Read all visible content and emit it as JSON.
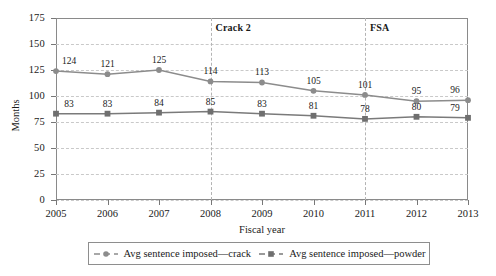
{
  "chart_data": {
    "type": "line",
    "title": "",
    "xlabel": "Fiscal year",
    "ylabel": "Months",
    "categories": [
      "2005",
      "2006",
      "2007",
      "2008",
      "2009",
      "2010",
      "2011",
      "2012",
      "2013"
    ],
    "x": [
      2005,
      2006,
      2007,
      2008,
      2009,
      2010,
      2011,
      2012,
      2013
    ],
    "xlim": [
      2005,
      2013
    ],
    "ylim": [
      0,
      175
    ],
    "yticks": [
      0,
      25,
      50,
      75,
      100,
      125,
      150,
      175
    ],
    "ytick_labels": [
      "0",
      "25",
      "50",
      "75",
      "100",
      "125",
      "150",
      "175"
    ],
    "grid": true,
    "grid_style": "dashed-horizontal",
    "legend_position": "below-axis",
    "series": [
      {
        "name": "Avg sentence imposed—crack",
        "marker": "circle",
        "color": "#8c8c8c",
        "values": [
          124,
          121,
          125,
          114,
          113,
          105,
          101,
          95,
          96
        ],
        "labels": [
          "124",
          "121",
          "125",
          "114",
          "113",
          "105",
          "101",
          "95",
          "96"
        ]
      },
      {
        "name": "Avg sentence imposed—powder",
        "marker": "square",
        "color": "#7a7a7a",
        "values": [
          83,
          83,
          84,
          85,
          83,
          81,
          78,
          80,
          79
        ],
        "labels": [
          "83",
          "83",
          "84",
          "85",
          "83",
          "81",
          "78",
          "80",
          "79"
        ]
      }
    ],
    "annotations": [
      {
        "text": "Crack 2",
        "at_x": 2008,
        "vline": true
      },
      {
        "text": "FSA",
        "at_x": 2011,
        "vline": true
      }
    ]
  },
  "legend": {
    "entries": [
      {
        "label": "Avg sentence imposed—crack"
      },
      {
        "label": "Avg sentence imposed—powder"
      }
    ]
  },
  "colors": {
    "crack_line": "#8c8c8c",
    "powder_line": "#7a7a7a",
    "gridline": "#c9c9c9",
    "frame": "#8a8a8a",
    "text": "#1a1a1a"
  }
}
